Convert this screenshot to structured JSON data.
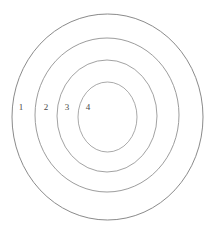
{
  "diagram": {
    "kind": "concentric-rings",
    "background_color": "#ffffff",
    "stroke_color": "#8c8c8c",
    "label_color": "#4a4a4a",
    "rings": [
      {
        "label": "1",
        "name": "ring-1-outer",
        "cx": 107.5,
        "cy": 117.0,
        "rx": 95.5,
        "ry": 103.0,
        "stroke": "#7d7d7d",
        "stroke_width": 0.9,
        "label_x": 21,
        "label_y": 108
      },
      {
        "label": "2",
        "name": "ring-2",
        "cx": 107.0,
        "cy": 115.0,
        "rx": 72.0,
        "ry": 77.0,
        "stroke": "#8a8a8a",
        "stroke_width": 0.85,
        "label_x": 46,
        "label_y": 108
      },
      {
        "label": "3",
        "name": "ring-3",
        "cx": 107.0,
        "cy": 116.0,
        "rx": 50.0,
        "ry": 56.0,
        "stroke": "#919191",
        "stroke_width": 0.85,
        "label_x": 67,
        "label_y": 108
      },
      {
        "label": "4",
        "name": "ring-4-inner",
        "cx": 107.5,
        "cy": 117.0,
        "rx": 29.5,
        "ry": 35.0,
        "stroke": "#9a9a9a",
        "stroke_width": 0.85,
        "label_x": 88,
        "label_y": 108
      }
    ]
  }
}
